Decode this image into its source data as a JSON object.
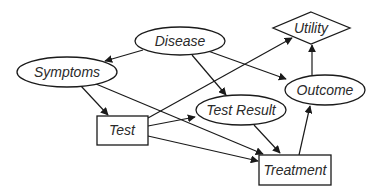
{
  "diagram": {
    "type": "influence-diagram",
    "colors": {
      "stroke": "#1a1a1a",
      "text": "#2a2a2a",
      "background": "#ffffff"
    },
    "nodes": [
      {
        "id": "disease",
        "label": "Disease",
        "shape": "ellipse",
        "kind": "chance"
      },
      {
        "id": "symptoms",
        "label": "Symptoms",
        "shape": "ellipse",
        "kind": "chance"
      },
      {
        "id": "utility",
        "label": "Utility",
        "shape": "diamond",
        "kind": "utility"
      },
      {
        "id": "outcome",
        "label": "Outcome",
        "shape": "ellipse",
        "kind": "chance"
      },
      {
        "id": "test_result",
        "label": "Test Result",
        "shape": "ellipse",
        "kind": "chance"
      },
      {
        "id": "test",
        "label": "Test",
        "shape": "rectangle",
        "kind": "decision"
      },
      {
        "id": "treatment",
        "label": "Treatment",
        "shape": "rectangle",
        "kind": "decision"
      }
    ],
    "edges": [
      {
        "from": "disease",
        "to": "symptoms"
      },
      {
        "from": "disease",
        "to": "test_result"
      },
      {
        "from": "disease",
        "to": "outcome"
      },
      {
        "from": "symptoms",
        "to": "test"
      },
      {
        "from": "symptoms",
        "to": "treatment"
      },
      {
        "from": "test",
        "to": "utility"
      },
      {
        "from": "test",
        "to": "test_result"
      },
      {
        "from": "test",
        "to": "treatment"
      },
      {
        "from": "test_result",
        "to": "treatment"
      },
      {
        "from": "treatment",
        "to": "outcome"
      },
      {
        "from": "outcome",
        "to": "utility"
      }
    ]
  }
}
